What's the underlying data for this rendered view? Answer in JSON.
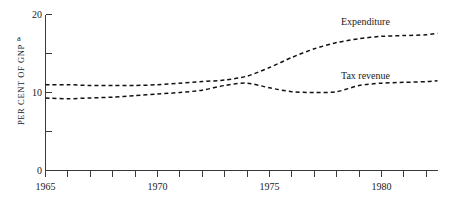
{
  "chart_data": {
    "type": "line",
    "title": "",
    "subtitle": "",
    "xlabel": "",
    "ylabel": "PER CENT OF GNP",
    "ylabel_note": "a",
    "xlim": [
      1965,
      1982.5
    ],
    "ylim": [
      0,
      20
    ],
    "grid": false,
    "legend_position": "inline-right",
    "y_ticks": [
      0,
      5,
      10,
      15,
      20
    ],
    "y_tick_labels": [
      "0",
      "",
      "10",
      "",
      "20"
    ],
    "x_ticks": [
      1965,
      1966,
      1967,
      1968,
      1969,
      1970,
      1971,
      1972,
      1973,
      1974,
      1975,
      1976,
      1977,
      1978,
      1979,
      1980,
      1981,
      1982,
      1982.5
    ],
    "x_tick_labels": [
      "1965",
      "",
      "",
      "",
      "",
      "1970",
      "",
      "",
      "",
      "",
      "1975",
      "",
      "",
      "",
      "",
      "1980",
      "",
      "",
      ""
    ],
    "x": [
      1965,
      1966,
      1967,
      1968,
      1969,
      1970,
      1971,
      1972,
      1973,
      1974,
      1975,
      1976,
      1977,
      1978,
      1979,
      1980,
      1981,
      1982,
      1982.5
    ],
    "series": [
      {
        "name": "Expenditure",
        "style": "dashed",
        "color": "#111111",
        "values": [
          11.0,
          11.0,
          10.9,
          10.9,
          10.9,
          11.0,
          11.2,
          11.4,
          11.6,
          12.1,
          13.2,
          14.5,
          15.6,
          16.4,
          16.9,
          17.2,
          17.3,
          17.4,
          17.6
        ]
      },
      {
        "name": "Tax revenue",
        "style": "dashed",
        "color": "#111111",
        "values": [
          9.3,
          9.2,
          9.3,
          9.4,
          9.6,
          9.8,
          10.0,
          10.3,
          10.9,
          11.2,
          10.6,
          10.1,
          10.0,
          10.1,
          10.9,
          11.2,
          11.3,
          11.4,
          11.5
        ]
      }
    ],
    "annotations": [
      {
        "text": "Expenditure",
        "x": 1980.0,
        "y": 19.0
      },
      {
        "text": "Tax revenue",
        "x": 1979.8,
        "y": 12.9
      }
    ]
  },
  "colors": {
    "background": "#ffffff",
    "axis": "#3a3a3a",
    "ink": "#111111",
    "text": "#1a1a1a"
  }
}
